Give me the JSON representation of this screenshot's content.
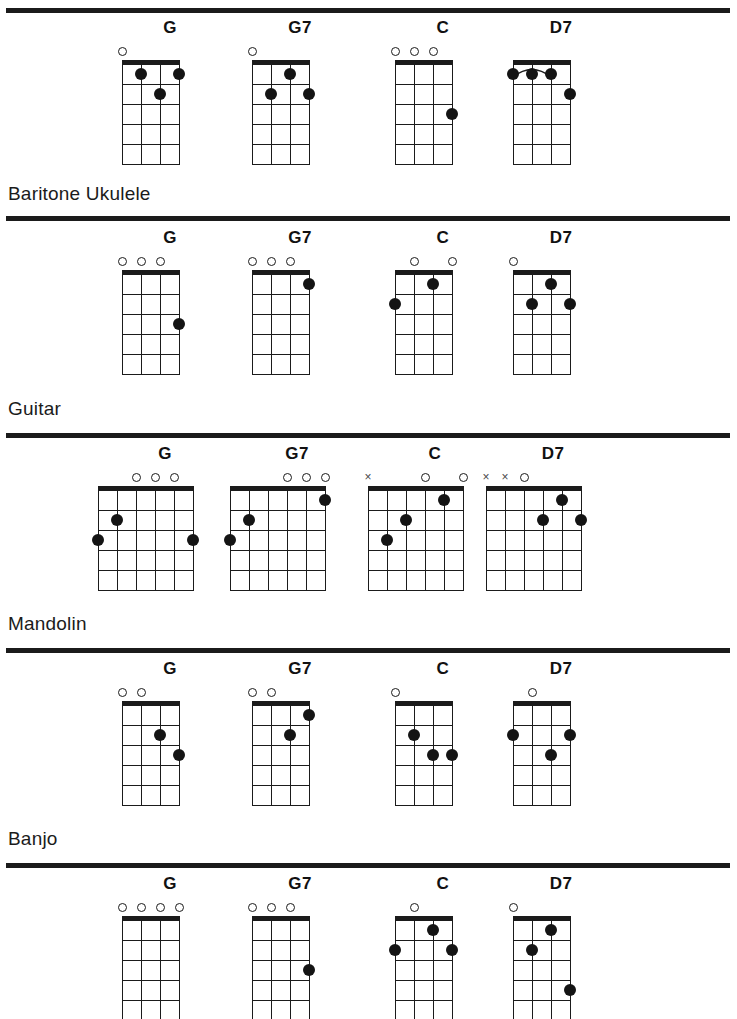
{
  "page": {
    "width": 737,
    "height": 1019,
    "ink_color": "#1b1b1b",
    "dot_color": "#141414"
  },
  "sections": [
    {
      "id": "soprano-ukulele",
      "label": "",
      "label_visible": false,
      "strings": 4,
      "frets": 5,
      "row_top": 18,
      "rule_top": 8,
      "title_top": 0,
      "chords": [
        {
          "name": "G",
          "left": 95,
          "markers": [
            {
              "string": 1,
              "type": "open"
            }
          ],
          "dots": [
            {
              "string": 2,
              "fret": 1
            },
            {
              "string": 4,
              "fret": 1
            },
            {
              "string": 3,
              "fret": 2
            }
          ],
          "barre": null
        },
        {
          "name": "G7",
          "left": 225,
          "markers": [
            {
              "string": 1,
              "type": "open"
            }
          ],
          "dots": [
            {
              "string": 3,
              "fret": 1
            },
            {
              "string": 2,
              "fret": 2
            },
            {
              "string": 4,
              "fret": 2
            }
          ],
          "barre": null
        },
        {
          "name": "C",
          "left": 368,
          "markers": [
            {
              "string": 1,
              "type": "open"
            },
            {
              "string": 2,
              "type": "open"
            },
            {
              "string": 3,
              "type": "open"
            }
          ],
          "dots": [
            {
              "string": 4,
              "fret": 3
            }
          ],
          "barre": null
        },
        {
          "name": "D7",
          "left": 486,
          "markers": [],
          "dots": [
            {
              "string": 1,
              "fret": 1
            },
            {
              "string": 2,
              "fret": 1
            },
            {
              "string": 3,
              "fret": 1
            },
            {
              "string": 4,
              "fret": 2
            }
          ],
          "barre": {
            "fret": 1,
            "from_string": 1,
            "to_string": 3
          }
        }
      ]
    },
    {
      "id": "baritone-ukulele",
      "label": "Baritone Ukulele",
      "label_visible": true,
      "strings": 4,
      "frets": 5,
      "row_top": 228,
      "rule_top": 216,
      "title_top": 183,
      "chords": [
        {
          "name": "G",
          "left": 95,
          "markers": [
            {
              "string": 1,
              "type": "open"
            },
            {
              "string": 2,
              "type": "open"
            },
            {
              "string": 3,
              "type": "open"
            }
          ],
          "dots": [
            {
              "string": 4,
              "fret": 3
            }
          ],
          "barre": null
        },
        {
          "name": "G7",
          "left": 225,
          "markers": [
            {
              "string": 1,
              "type": "open"
            },
            {
              "string": 2,
              "type": "open"
            },
            {
              "string": 3,
              "type": "open"
            }
          ],
          "dots": [
            {
              "string": 4,
              "fret": 1
            }
          ],
          "barre": null
        },
        {
          "name": "C",
          "left": 368,
          "markers": [
            {
              "string": 2,
              "type": "open"
            },
            {
              "string": 4,
              "type": "open"
            }
          ],
          "dots": [
            {
              "string": 3,
              "fret": 1
            },
            {
              "string": 1,
              "fret": 2
            }
          ],
          "barre": null
        },
        {
          "name": "D7",
          "left": 486,
          "markers": [
            {
              "string": 1,
              "type": "open"
            }
          ],
          "dots": [
            {
              "string": 3,
              "fret": 1
            },
            {
              "string": 2,
              "fret": 2
            },
            {
              "string": 4,
              "fret": 2
            }
          ],
          "barre": null
        }
      ]
    },
    {
      "id": "guitar",
      "label": "Guitar",
      "label_visible": true,
      "strings": 6,
      "frets": 5,
      "row_top": 444,
      "rule_top": 433,
      "title_top": 398,
      "chords": [
        {
          "name": "G",
          "left": 90,
          "markers": [
            {
              "string": 3,
              "type": "open"
            },
            {
              "string": 4,
              "type": "open"
            },
            {
              "string": 5,
              "type": "open"
            }
          ],
          "dots": [
            {
              "string": 2,
              "fret": 2
            },
            {
              "string": 1,
              "fret": 3
            },
            {
              "string": 6,
              "fret": 3
            }
          ],
          "barre": null
        },
        {
          "name": "G7",
          "left": 222,
          "markers": [
            {
              "string": 4,
              "type": "open"
            },
            {
              "string": 5,
              "type": "open"
            },
            {
              "string": 6,
              "type": "open"
            }
          ],
          "dots": [
            {
              "string": 6,
              "fret": 1
            },
            {
              "string": 2,
              "fret": 2
            },
            {
              "string": 1,
              "fret": 3
            }
          ],
          "barre": null
        },
        {
          "name": "C",
          "left": 360,
          "markers": [
            {
              "string": 1,
              "type": "muted"
            },
            {
              "string": 4,
              "type": "open"
            },
            {
              "string": 6,
              "type": "open"
            }
          ],
          "dots": [
            {
              "string": 5,
              "fret": 1
            },
            {
              "string": 3,
              "fret": 2
            },
            {
              "string": 2,
              "fret": 3
            }
          ],
          "barre": null
        },
        {
          "name": "D7",
          "left": 478,
          "markers": [
            {
              "string": 1,
              "type": "muted"
            },
            {
              "string": 2,
              "type": "muted"
            },
            {
              "string": 3,
              "type": "open"
            }
          ],
          "dots": [
            {
              "string": 5,
              "fret": 1
            },
            {
              "string": 4,
              "fret": 2
            },
            {
              "string": 6,
              "fret": 2
            }
          ],
          "barre": null
        }
      ]
    },
    {
      "id": "mandolin",
      "label": "Mandolin",
      "label_visible": true,
      "strings": 4,
      "frets": 5,
      "row_top": 659,
      "rule_top": 648,
      "title_top": 613,
      "chords": [
        {
          "name": "G",
          "left": 95,
          "markers": [
            {
              "string": 1,
              "type": "open"
            },
            {
              "string": 2,
              "type": "open"
            }
          ],
          "dots": [
            {
              "string": 3,
              "fret": 2
            },
            {
              "string": 4,
              "fret": 3
            }
          ],
          "barre": null
        },
        {
          "name": "G7",
          "left": 225,
          "markers": [
            {
              "string": 1,
              "type": "open"
            },
            {
              "string": 2,
              "type": "open"
            }
          ],
          "dots": [
            {
              "string": 4,
              "fret": 1
            },
            {
              "string": 3,
              "fret": 2
            }
          ],
          "barre": null
        },
        {
          "name": "C",
          "left": 368,
          "markers": [
            {
              "string": 1,
              "type": "open"
            }
          ],
          "dots": [
            {
              "string": 2,
              "fret": 2
            },
            {
              "string": 3,
              "fret": 3
            },
            {
              "string": 4,
              "fret": 3
            }
          ],
          "barre": null
        },
        {
          "name": "D7",
          "left": 486,
          "markers": [
            {
              "string": 2,
              "type": "open"
            }
          ],
          "dots": [
            {
              "string": 1,
              "fret": 2
            },
            {
              "string": 4,
              "fret": 2
            },
            {
              "string": 3,
              "fret": 3
            }
          ],
          "barre": null
        }
      ]
    },
    {
      "id": "banjo",
      "label": "Banjo",
      "label_visible": true,
      "strings": 4,
      "frets": 5,
      "row_top": 874,
      "rule_top": 863,
      "title_top": 828,
      "chords": [
        {
          "name": "G",
          "left": 95,
          "markers": [
            {
              "string": 1,
              "type": "open"
            },
            {
              "string": 2,
              "type": "open"
            },
            {
              "string": 3,
              "type": "open"
            },
            {
              "string": 4,
              "type": "open"
            }
          ],
          "dots": [],
          "barre": null
        },
        {
          "name": "G7",
          "left": 225,
          "markers": [
            {
              "string": 1,
              "type": "open"
            },
            {
              "string": 2,
              "type": "open"
            },
            {
              "string": 3,
              "type": "open"
            }
          ],
          "dots": [
            {
              "string": 4,
              "fret": 3
            }
          ],
          "barre": null
        },
        {
          "name": "C",
          "left": 368,
          "markers": [
            {
              "string": 2,
              "type": "open"
            }
          ],
          "dots": [
            {
              "string": 3,
              "fret": 1
            },
            {
              "string": 1,
              "fret": 2
            },
            {
              "string": 4,
              "fret": 2
            }
          ],
          "barre": null
        },
        {
          "name": "D7",
          "left": 486,
          "markers": [
            {
              "string": 1,
              "type": "open"
            }
          ],
          "dots": [
            {
              "string": 3,
              "fret": 1
            },
            {
              "string": 2,
              "fret": 2
            },
            {
              "string": 4,
              "fret": 4
            }
          ],
          "barre": null
        }
      ]
    }
  ]
}
